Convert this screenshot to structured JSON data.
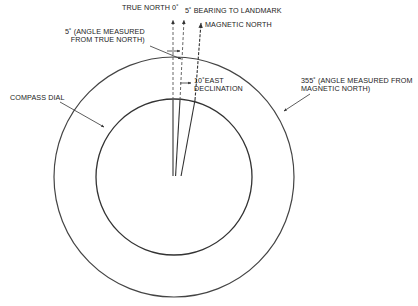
{
  "diagram": {
    "labels": {
      "true_north": "TRUE NORTH 0˚",
      "bearing": "5˚ BEARING TO LANDMARK",
      "magnetic_north": "MAGNETIC NORTH",
      "angle_true_line1": "5˚ (ANGLE MEASURED",
      "angle_true_line2": "FROM TRUE NORTH)",
      "declination_line1": "10˚EAST",
      "declination_line2": "DECLINATION",
      "compass_dial": "COMPASS DIAL",
      "angle_magnetic_line1": "355˚ (ANGLE MEASURED FROM",
      "angle_magnetic_line2": "MAGNETIC NORTH)"
    },
    "angles_deg": {
      "true_north": 0,
      "bearing_to_landmark": 5,
      "magnetic_north": 10,
      "declination_east": 10,
      "angle_from_magnetic_north": 355
    },
    "colors": {
      "line": "#333333",
      "text": "#222222",
      "background": "#ffffff"
    }
  }
}
